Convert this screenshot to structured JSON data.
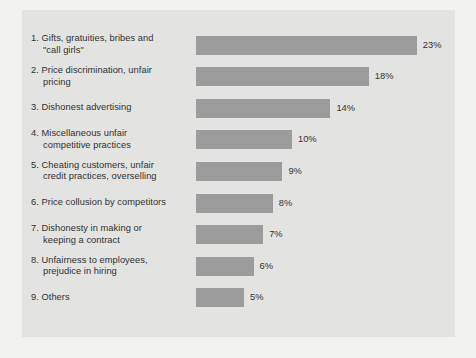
{
  "chart_data": {
    "type": "bar",
    "orientation": "horizontal",
    "title": "",
    "subtitle": "",
    "xlabel": "",
    "ylabel": "",
    "xlim": [
      0,
      23
    ],
    "grid": false,
    "legend": null,
    "value_suffix": "%",
    "categories": [
      "1. Gifts, gratuities, bribes and\n\"call girls\"",
      "2. Price discrimination, unfair\npricing",
      "3. Dishonest advertising",
      "4. Miscellaneous unfair\ncompetitive practices",
      "5. Cheating customers, unfair\ncredit practices, overselling",
      "6. Price collusion by competitors",
      "7. Dishonesty in making or\nkeeping a contract",
      "8. Unfairness to employees,\nprejudice in hiring",
      "9. Others"
    ],
    "values": [
      23,
      18,
      14,
      10,
      9,
      8,
      7,
      6,
      5
    ],
    "value_labels": [
      "23%",
      "18%",
      "14%",
      "10%",
      "9%",
      "8%",
      "7%",
      "6%",
      "5%"
    ],
    "colors": {
      "bar_fill": "#9c9c9c",
      "panel_background": "#e3e3e1",
      "page_background": "#f2f2f0",
      "text": "#2f3133"
    }
  }
}
